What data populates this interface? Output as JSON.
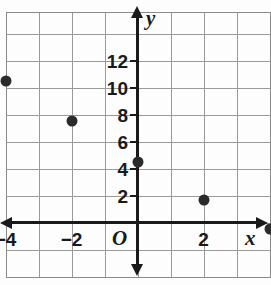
{
  "chart_data": {
    "type": "scatter",
    "title": "",
    "xlabel": "x",
    "ylabel": "y",
    "grid": true,
    "legend": "none",
    "origin_label": "O",
    "xlim": [
      -4.7,
      5.3
    ],
    "ylim": [
      -1.5,
      14.0
    ],
    "x_tick_step": 1,
    "y_tick_step": 2,
    "x_ticks": [
      {
        "value": -4,
        "label": "−4"
      },
      {
        "value": -2,
        "label": "−2"
      },
      {
        "value": 2,
        "label": "2"
      }
    ],
    "y_ticks": [
      {
        "value": 12,
        "label": "12"
      },
      {
        "value": 10,
        "label": "10"
      },
      {
        "value": 8,
        "label": "8"
      },
      {
        "value": 6,
        "label": "6"
      },
      {
        "value": 4,
        "label": "4"
      },
      {
        "value": 2,
        "label": "2"
      }
    ],
    "points": [
      {
        "x": -4,
        "y": 10.5
      },
      {
        "x": -2,
        "y": 7.5
      },
      {
        "x": 0,
        "y": 4.5
      },
      {
        "x": 2,
        "y": 1.7
      },
      {
        "x": 4,
        "y": -0.5
      }
    ],
    "marker_color": "#2b2b2b",
    "axis_color": "#1a1a1a",
    "grid_color": "#9a9a9a"
  }
}
